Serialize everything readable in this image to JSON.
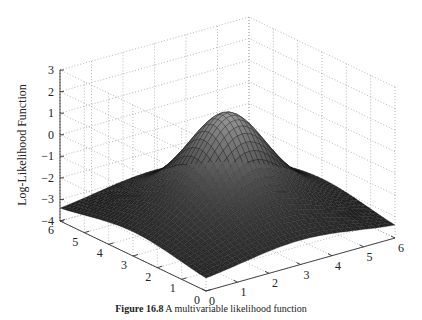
{
  "chart_data": {
    "type": "surface3d",
    "title": "",
    "caption_label": "Figure 16.8",
    "caption_text": "A multivariable likelihood function",
    "xlabel": "",
    "ylabel": "",
    "zlabel": "Log-Likelihood Function",
    "xlim": [
      0,
      6
    ],
    "ylim": [
      0,
      6
    ],
    "zlim": [
      -4,
      3
    ],
    "x_ticks": [
      0,
      1,
      2,
      3,
      4,
      5,
      6
    ],
    "y_ticks": [
      0,
      1,
      2,
      3,
      4,
      5,
      6
    ],
    "z_ticks": [
      -4,
      -3,
      -2,
      -1,
      0,
      1,
      2,
      3
    ],
    "grid": true,
    "grid_style": "dotted",
    "colormap": "gray",
    "surface_description": "Two superimposed bell-shaped bumps centered at (3,3): a broad low dome and a narrow taller peak; edges near -3.3, corners lowest",
    "center": [
      3,
      3
    ],
    "peak_z": 1.4,
    "edge_z": -3.3,
    "mesh_resolution": 40
  }
}
